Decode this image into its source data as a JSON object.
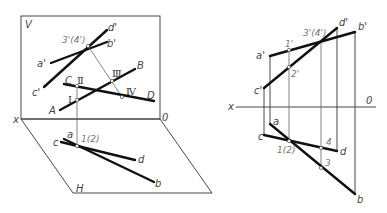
{
  "left_figure": {
    "plane_v_label": "V",
    "plane_h_label": "H",
    "axis_x_label": "x",
    "axis_o_label": "0",
    "v_labels": {
      "a_prime": "a'",
      "b_prime": "b'",
      "c_prime": "c'",
      "d_prime": "d'",
      "cross": "3'(4')"
    },
    "space_labels": {
      "A": "A",
      "B": "B",
      "C": "C",
      "D": "D",
      "I": "Ⅰ",
      "II": "Ⅱ",
      "III": "Ⅲ",
      "IV": "Ⅳ"
    },
    "h_labels": {
      "a": "a",
      "b": "b",
      "c": "c",
      "d": "d",
      "cross": "1(2)"
    }
  },
  "right_figure": {
    "axis_x_label": "x",
    "axis_o_label": "0",
    "v_labels": {
      "a_prime": "a'",
      "b_prime": "b'",
      "c_prime": "c'",
      "d_prime": "d'",
      "one_prime": "1'",
      "two_prime": "2'",
      "cross": "3'(4')"
    },
    "h_labels": {
      "a": "a",
      "b": "b",
      "c": "c",
      "d": "d",
      "cross": "1(2)",
      "three": "3",
      "four": "4"
    }
  }
}
